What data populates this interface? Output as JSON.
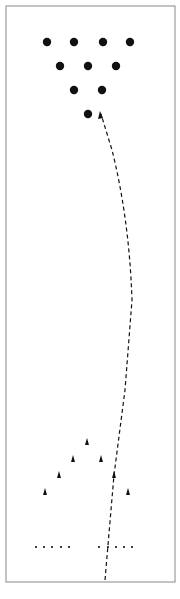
{
  "diagram": {
    "type": "bowling-lane",
    "caption": "",
    "lane": {
      "x": 6,
      "y": 6,
      "width": 169,
      "height": 576,
      "border_color": "#888888"
    },
    "pins": [
      {
        "x": 47,
        "y": 42
      },
      {
        "x": 74,
        "y": 42
      },
      {
        "x": 103,
        "y": 42
      },
      {
        "x": 130,
        "y": 42
      },
      {
        "x": 60,
        "y": 66
      },
      {
        "x": 88,
        "y": 66
      },
      {
        "x": 116,
        "y": 66
      },
      {
        "x": 74,
        "y": 90
      },
      {
        "x": 102,
        "y": 90
      },
      {
        "x": 88,
        "y": 114
      }
    ],
    "target_arrows": [
      {
        "x": 87,
        "y": 442
      },
      {
        "x": 73,
        "y": 459
      },
      {
        "x": 101,
        "y": 459
      },
      {
        "x": 59,
        "y": 475
      },
      {
        "x": 114,
        "y": 475
      },
      {
        "x": 45,
        "y": 492
      },
      {
        "x": 128,
        "y": 492
      }
    ],
    "approach_dots": [
      {
        "x": 36,
        "y": 547
      },
      {
        "x": 44,
        "y": 547
      },
      {
        "x": 52,
        "y": 547
      },
      {
        "x": 61,
        "y": 547
      },
      {
        "x": 69,
        "y": 547
      },
      {
        "x": 99,
        "y": 547
      },
      {
        "x": 108,
        "y": 547
      },
      {
        "x": 116,
        "y": 547
      },
      {
        "x": 124,
        "y": 547
      },
      {
        "x": 132,
        "y": 547
      }
    ],
    "ball_path": {
      "style": "dashed",
      "color": "#111111",
      "d": "M105,580 L114,475 L125,390 L132,300 C130,240 122,190 112,150 L101,114"
    },
    "colors": {
      "pin": "#111111",
      "arrow": "#111111",
      "dot": "#111111"
    }
  }
}
